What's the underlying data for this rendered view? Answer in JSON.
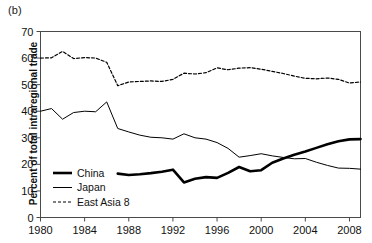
{
  "figure": {
    "panel_label": "(b)",
    "ylabel": "Percent of total intraregional trade"
  },
  "chart_data": {
    "type": "line",
    "title": "",
    "xlabel": "",
    "ylabel": "Percent of total intraregional trade",
    "xlim": [
      1980,
      2009
    ],
    "ylim": [
      0,
      70
    ],
    "ytick_labels": [
      "0",
      "10",
      "20",
      "30",
      "40",
      "50",
      "60",
      "70"
    ],
    "yticks": [
      0,
      10,
      20,
      30,
      40,
      50,
      60,
      70
    ],
    "xtick_labels": [
      "1980",
      "1984",
      "1988",
      "1992",
      "1996",
      "2000",
      "2004",
      "2008"
    ],
    "xticks": [
      1980,
      1984,
      1988,
      1992,
      1996,
      2000,
      2004,
      2008
    ],
    "grid": false,
    "legend_position": "lower-left-inside",
    "series": [
      {
        "name": "China",
        "style": "solid-thick",
        "color": "#000000",
        "x": [
          1987,
          1988,
          1989,
          1990,
          1991,
          1992,
          1993,
          1994,
          1995,
          1996,
          1997,
          1998,
          1999,
          2000,
          2001,
          2002,
          2003,
          2004,
          2005,
          2006,
          2007,
          2008,
          2009
        ],
        "values": [
          16.5,
          16.0,
          16.3,
          16.7,
          17.2,
          18.0,
          13.2,
          14.6,
          15.2,
          14.9,
          16.8,
          19.0,
          17.4,
          17.8,
          20.6,
          22.2,
          23.6,
          24.8,
          26.2,
          27.6,
          28.7,
          29.4,
          29.5
        ]
      },
      {
        "name": "Japan",
        "style": "solid-thin",
        "color": "#000000",
        "x": [
          1980,
          1981,
          1982,
          1983,
          1984,
          1985,
          1986,
          1987,
          1988,
          1989,
          1990,
          1991,
          1992,
          1993,
          1994,
          1995,
          1996,
          1997,
          1998,
          1999,
          2000,
          2001,
          2002,
          2003,
          2004,
          2005,
          2006,
          2007,
          2008,
          2009
        ],
        "values": [
          40.0,
          41.0,
          37.0,
          39.5,
          40.0,
          39.8,
          43.5,
          33.5,
          32.2,
          31.0,
          30.2,
          30.0,
          29.5,
          31.5,
          30.0,
          29.5,
          28.2,
          26.0,
          22.7,
          23.3,
          24.0,
          23.2,
          22.6,
          22.1,
          22.2,
          20.8,
          19.6,
          18.6,
          18.5,
          18.2
        ]
      },
      {
        "name": "East Asia 8",
        "style": "dashed",
        "color": "#000000",
        "x": [
          1980,
          1981,
          1982,
          1983,
          1984,
          1985,
          1986,
          1987,
          1988,
          1989,
          1990,
          1991,
          1992,
          1993,
          1994,
          1995,
          1996,
          1997,
          1998,
          1999,
          2000,
          2001,
          2002,
          2003,
          2004,
          2005,
          2006,
          2007,
          2008,
          2009
        ],
        "values": [
          60.0,
          60.1,
          62.5,
          59.8,
          60.2,
          60.0,
          58.4,
          49.6,
          51.0,
          51.2,
          51.4,
          51.2,
          52.0,
          54.3,
          54.0,
          54.5,
          56.3,
          55.6,
          56.2,
          56.4,
          55.8,
          55.0,
          54.2,
          53.2,
          52.4,
          52.2,
          52.5,
          52.0,
          50.6,
          51.0
        ]
      }
    ]
  },
  "legend": {
    "items": [
      {
        "label": "China",
        "style": "solid-thick"
      },
      {
        "label": "Japan",
        "style": "solid-thin"
      },
      {
        "label": "East Asia 8",
        "style": "dashed"
      }
    ]
  }
}
